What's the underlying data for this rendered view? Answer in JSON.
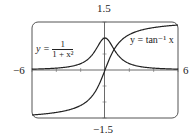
{
  "chart_data": {
    "type": "line",
    "title": "",
    "xlabel": "",
    "ylabel": "",
    "xlim": [
      -6,
      6
    ],
    "ylim": [
      -1.5,
      1.5
    ],
    "tick_labels": {
      "x_min": "−6",
      "x_max": "6",
      "y_max": "1.5",
      "y_min": "−1.5"
    },
    "grid": false,
    "series": [
      {
        "name": "y = 1/(1 + x^2)",
        "label_prefix": "y =",
        "label_num": "1",
        "label_den": "1 + x²",
        "x": [
          -6,
          -5,
          -4,
          -3,
          -2,
          -1,
          -0.5,
          0,
          0.5,
          1,
          2,
          3,
          4,
          5,
          6
        ],
        "values": [
          0.027,
          0.038,
          0.059,
          0.1,
          0.2,
          0.5,
          0.8,
          1.0,
          0.8,
          0.5,
          0.2,
          0.1,
          0.059,
          0.038,
          0.027
        ]
      },
      {
        "name": "y = tan^-1 x",
        "label": "y = tan⁻¹ x",
        "x": [
          -6,
          -5,
          -4,
          -3,
          -2,
          -1,
          -0.5,
          0,
          0.5,
          1,
          2,
          3,
          4,
          5,
          6
        ],
        "values": [
          -1.406,
          -1.373,
          -1.326,
          -1.249,
          -1.107,
          -0.785,
          -0.464,
          0,
          0.464,
          0.785,
          1.107,
          1.249,
          1.326,
          1.373,
          1.406
        ]
      }
    ]
  }
}
